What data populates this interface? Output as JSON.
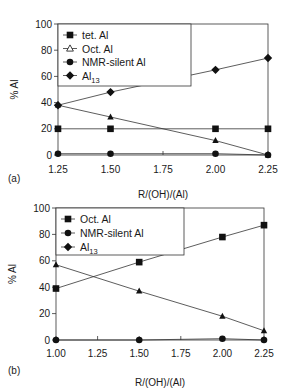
{
  "chart_data": [
    {
      "panel": "(a)",
      "type": "line",
      "title": "",
      "xlabel": "R/(OH)/(Al)",
      "ylabel": "% Al",
      "xlim": [
        1.25,
        2.25
      ],
      "ylim": [
        0,
        100
      ],
      "xticks": [
        "1.25",
        "1.50",
        "1.75",
        "2.00",
        "2.25"
      ],
      "yticks": [
        "0",
        "20",
        "40",
        "60",
        "80",
        "100"
      ],
      "grid": false,
      "legend_position": "top-left",
      "x": [
        1.25,
        1.5,
        2.0,
        2.25
      ],
      "series": [
        {
          "name": "tet. Al",
          "marker": "square",
          "values": [
            20,
            20,
            20,
            20
          ]
        },
        {
          "name": "Oct. Al",
          "marker": "triangle",
          "values": [
            38,
            29,
            11,
            0
          ]
        },
        {
          "name": "NMR-silent Al",
          "marker": "circle",
          "values": [
            1,
            1,
            1,
            0
          ]
        },
        {
          "name": "Al13",
          "marker": "diamond",
          "values": [
            38,
            48,
            65,
            74
          ]
        }
      ],
      "legend": [
        {
          "label": "tet. Al",
          "sub": "",
          "marker": "square"
        },
        {
          "label": "Oct. Al",
          "sub": "",
          "marker": "triangle-open"
        },
        {
          "label": "NMR-silent Al",
          "sub": "",
          "marker": "circle"
        },
        {
          "label": "Al",
          "sub": "13",
          "marker": "diamond"
        }
      ]
    },
    {
      "panel": "(b)",
      "type": "line",
      "title": "",
      "xlabel": "R/(OH)/(Al)",
      "ylabel": "% Al",
      "xlim": [
        1.0,
        2.25
      ],
      "ylim": [
        0,
        100
      ],
      "xticks": [
        "1.00",
        "1.25",
        "1.50",
        "1.75",
        "2.00",
        "2.25"
      ],
      "yticks": [
        "0",
        "20",
        "40",
        "60",
        "80",
        "100"
      ],
      "grid": false,
      "legend_position": "top-left",
      "x": [
        1.0,
        1.5,
        2.0,
        2.25
      ],
      "series": [
        {
          "name": "Oct. Al",
          "marker": "square",
          "values": [
            39,
            59,
            78,
            87
          ]
        },
        {
          "name": "NMR-silent Al",
          "marker": "circle",
          "values": [
            0,
            0,
            1,
            0
          ]
        },
        {
          "name": "Al13",
          "marker": "triangle",
          "values": [
            57,
            37,
            18,
            7
          ]
        }
      ],
      "legend": [
        {
          "label": "Oct. Al",
          "sub": "",
          "marker": "square"
        },
        {
          "label": "NMR-silent Al",
          "sub": "",
          "marker": "circle"
        },
        {
          "label": "Al",
          "sub": "13",
          "marker": "diamond"
        }
      ]
    }
  ]
}
